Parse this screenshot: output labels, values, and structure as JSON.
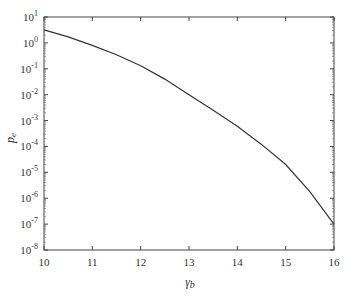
{
  "chart_data": {
    "type": "line",
    "title": "",
    "xlabel": "γb",
    "ylabel": "pe",
    "xlim": [
      10,
      16
    ],
    "ylim": [
      1e-08,
      10
    ],
    "yscale": "log",
    "grid": false,
    "legend": null,
    "x_ticks": [
      "10",
      "11",
      "12",
      "13",
      "14",
      "15",
      "16"
    ],
    "y_ticks": [
      "10^1",
      "10^0",
      "10^-1",
      "10^-2",
      "10^-3",
      "10^-4",
      "10^-5",
      "10^-6",
      "10^-7",
      "10^-8"
    ],
    "series": [
      {
        "name": "pe",
        "color": "#333333",
        "x": [
          10,
          10.5,
          11,
          11.5,
          12,
          12.5,
          13,
          13.5,
          14,
          14.5,
          15,
          15.5,
          16
        ],
        "y": [
          3.2,
          1.7,
          0.8,
          0.35,
          0.13,
          0.04,
          0.01,
          0.0025,
          0.0006,
          0.00012,
          2e-05,
          1.8e-06,
          1e-07
        ]
      }
    ]
  },
  "labels": {
    "xlabel_main": "γ",
    "xlabel_sub": "b",
    "ylabel_main": "p",
    "ylabel_sub": "e"
  }
}
